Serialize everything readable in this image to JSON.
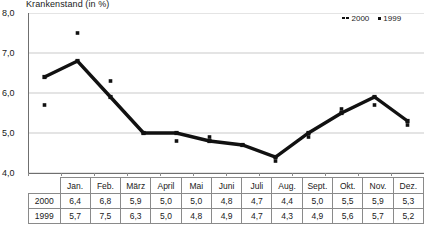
{
  "chart_data": {
    "type": "line",
    "title": "Krankenstand (in %)",
    "xlabel": "",
    "ylabel": "",
    "ylim": [
      4.0,
      8.0
    ],
    "yticks": [
      "4,0",
      "5,0",
      "6,0",
      "7,0",
      "8,0"
    ],
    "ytick_values": [
      4.0,
      5.0,
      6.0,
      7.0,
      8.0
    ],
    "grid": true,
    "legend_position": "top-right",
    "categories": [
      "Jan.",
      "Feb.",
      "März",
      "April",
      "Mai",
      "Juni",
      "Juli",
      "Aug.",
      "Sept.",
      "Okt.",
      "Nov.",
      "Dez."
    ],
    "series": [
      {
        "name": "2000",
        "style": "line-with-markers",
        "color": "#111111",
        "values": [
          6.4,
          6.8,
          5.9,
          5.0,
          5.0,
          4.8,
          4.7,
          4.4,
          5.0,
          5.5,
          5.9,
          5.3
        ],
        "labels": [
          "6,4",
          "6,8",
          "5,9",
          "5,0",
          "5,0",
          "4,8",
          "4,7",
          "4,4",
          "5,0",
          "5,5",
          "5,9",
          "5,3"
        ]
      },
      {
        "name": "1999",
        "style": "markers-only",
        "color": "#111111",
        "values": [
          5.7,
          7.5,
          6.3,
          5.0,
          4.8,
          4.9,
          4.7,
          4.3,
          4.9,
          5.6,
          5.7,
          5.2
        ],
        "labels": [
          "5,7",
          "7,5",
          "6,3",
          "5,0",
          "4,8",
          "4,9",
          "4,7",
          "4,3",
          "4,9",
          "5,6",
          "5,7",
          "5,2"
        ]
      }
    ]
  },
  "legend": {
    "entries": [
      {
        "label": "2000"
      },
      {
        "label": "1999"
      }
    ]
  },
  "table": {
    "corner": "",
    "columns": [
      "Jan.",
      "Feb.",
      "März",
      "April",
      "Mai",
      "Juni",
      "Juli",
      "Aug.",
      "Sept.",
      "Okt.",
      "Nov.",
      "Dez."
    ],
    "rows": [
      {
        "header": "2000",
        "cells": [
          "6,4",
          "6,8",
          "5,9",
          "5,0",
          "5,0",
          "4,8",
          "4,7",
          "4,4",
          "5,0",
          "5,5",
          "5,9",
          "5,3"
        ]
      },
      {
        "header": "1999",
        "cells": [
          "5,7",
          "7,5",
          "6,3",
          "5,0",
          "4,8",
          "4,9",
          "4,7",
          "4,3",
          "4,9",
          "5,6",
          "5,7",
          "5,2"
        ]
      }
    ]
  }
}
